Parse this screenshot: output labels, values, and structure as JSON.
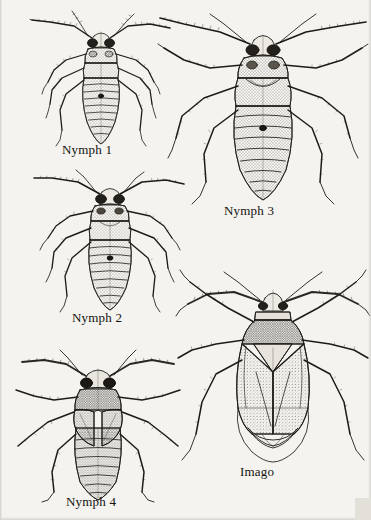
{
  "plate": {
    "title": "Developmental stages of a hemipteran bug",
    "background_color": "#f4f3f0",
    "ink_color": "#1a1814",
    "medium": "stippled pen-and-ink scientific illustration",
    "figure_count": 5
  },
  "figures": [
    {
      "id": "nymph-1",
      "label": "Nymph 1",
      "stage": "first instar nymph",
      "position": {
        "x": 30,
        "y": 8,
        "width": 140,
        "height": 140
      },
      "label_position": {
        "x": 62,
        "y": 142
      },
      "features": {
        "wing_pads": "absent",
        "eyes": "dark compound eyes",
        "abdomen_segments": 8,
        "antenna_segments": 4,
        "legs": 6
      }
    },
    {
      "id": "nymph-2",
      "label": "Nymph 2",
      "stage": "second instar nymph",
      "position": {
        "x": 34,
        "y": 168,
        "width": 150,
        "height": 146
      },
      "label_position": {
        "x": 72,
        "y": 310
      },
      "features": {
        "wing_pads": "absent",
        "eyes": "dark compound eyes",
        "abdomen_segments": 8,
        "antenna_segments": 4,
        "legs": 6
      }
    },
    {
      "id": "nymph-3",
      "label": "Nymph 3",
      "stage": "third instar nymph",
      "position": {
        "x": 158,
        "y": 10,
        "width": 208,
        "height": 196
      },
      "label_position": {
        "x": 224,
        "y": 203
      },
      "features": {
        "wing_pads": "small, emerging",
        "eyes": "dark compound eyes",
        "abdomen_segments": 8,
        "antenna_segments": 4,
        "legs": 6
      }
    },
    {
      "id": "nymph-4",
      "label": "Nymph 4",
      "stage": "fourth instar nymph",
      "position": {
        "x": 14,
        "y": 350,
        "width": 168,
        "height": 150
      },
      "label_position": {
        "x": 66,
        "y": 494
      },
      "features": {
        "wing_pads": "developed, covering anterior abdomen",
        "eyes": "dark compound eyes",
        "abdomen_segments": 7,
        "antenna_segments": 4,
        "legs": 6
      }
    },
    {
      "id": "imago",
      "label": "Imago",
      "stage": "adult",
      "position": {
        "x": 176,
        "y": 268,
        "width": 192,
        "height": 196
      },
      "label_position": {
        "x": 240,
        "y": 464
      },
      "features": {
        "wing_pads": "full forewings (hemelytra) with cuneus and membrane",
        "scutellum": "triangular",
        "eyes": "dark compound eyes",
        "antenna_segments": 4,
        "legs": 6
      }
    }
  ]
}
